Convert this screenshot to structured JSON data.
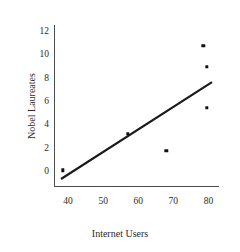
{
  "chart_data": {
    "type": "scatter",
    "title": "",
    "xlabel": "Internet Users",
    "ylabel": "Nobel Laureates",
    "xlim": [
      36,
      83
    ],
    "ylim": [
      -1.2,
      12.6
    ],
    "xticks": [
      40,
      50,
      60,
      70,
      80
    ],
    "yticks": [
      0,
      2,
      4,
      6,
      8,
      10,
      12
    ],
    "grid": false,
    "legend": null,
    "marker_color": "#111111",
    "line_color": "#1a1a1a",
    "points": [
      {
        "x": 38.5,
        "y": 0.15
      },
      {
        "x": 57.0,
        "y": 3.3
      },
      {
        "x": 68.0,
        "y": 1.8
      },
      {
        "x": 78.5,
        "y": 10.8
      },
      {
        "x": 79.5,
        "y": 9.0
      },
      {
        "x": 79.5,
        "y": 5.5
      }
    ],
    "trendline": {
      "x0": 38.0,
      "y0": -0.6,
      "x1": 81.0,
      "y1": 7.7
    }
  },
  "axes": {
    "x_tick_labels": [
      "40",
      "50",
      "60",
      "70",
      "80"
    ],
    "y_tick_labels": [
      "0",
      "2",
      "4",
      "6",
      "8",
      "10",
      "12"
    ],
    "x_title": "Internet Users",
    "y_title": "Nobel Laureates"
  }
}
